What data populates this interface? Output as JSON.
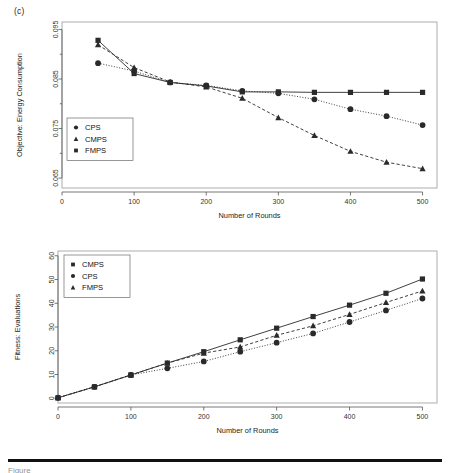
{
  "figure": {
    "panel_label": "(c)",
    "caption_fragment": "Figure"
  },
  "chart_data": [
    {
      "type": "line",
      "id": "objective-energy-consumption",
      "title": "",
      "xlabel": "Number of Rounds",
      "ylabel": "Objective: Energy Consumption",
      "xlim": [
        0,
        520
      ],
      "ylim": [
        0.063,
        0.0965
      ],
      "xticks": [
        0,
        100,
        200,
        300,
        400,
        500
      ],
      "yticks": [
        0.065,
        0.075,
        0.085,
        0.095
      ],
      "ytick_labels": [
        "0.065",
        "0.075",
        "0.085",
        "0.095"
      ],
      "xtick_labels": [
        "0",
        "100",
        "200",
        "300",
        "400",
        "500"
      ],
      "minor_ticks": true,
      "grid": false,
      "legend_position": "left-middle",
      "x": [
        50,
        100,
        150,
        200,
        250,
        300,
        350,
        400,
        450,
        500
      ],
      "series": [
        {
          "name": "CPS",
          "marker": "circle",
          "line_style": "dotted",
          "values": [
            0.0882,
            0.0866,
            0.0843,
            0.0837,
            0.0826,
            0.0821,
            0.0809,
            0.0789,
            0.0775,
            0.0757
          ]
        },
        {
          "name": "CMPS",
          "marker": "triangle",
          "line_style": "dashed",
          "values": [
            0.0919,
            0.0873,
            0.0844,
            0.0834,
            0.0811,
            0.0772,
            0.0736,
            0.0704,
            0.0682,
            0.0669
          ]
        },
        {
          "name": "FMPS",
          "marker": "square",
          "line_style": "solid",
          "values": [
            0.0928,
            0.0861,
            0.0843,
            0.0836,
            0.0824,
            0.0824,
            0.0823,
            0.0823,
            0.0823,
            0.0823
          ]
        }
      ],
      "legend": [
        "CPS",
        "CMPS",
        "FMPS"
      ]
    },
    {
      "type": "line",
      "id": "fitness-evaluations",
      "title": "",
      "xlabel": "Number of Rounds",
      "ylabel": "Fitness: Evaluations",
      "xlim": [
        0,
        520
      ],
      "ylim": [
        -2,
        62
      ],
      "xticks": [
        0,
        100,
        200,
        300,
        400,
        500
      ],
      "yticks": [
        0,
        10,
        20,
        30,
        40,
        50,
        60
      ],
      "ytick_labels": [
        "0",
        "10",
        "20",
        "30",
        "40",
        "50",
        "60"
      ],
      "xtick_labels": [
        "0",
        "100",
        "200",
        "300",
        "400",
        "500"
      ],
      "minor_ticks": false,
      "grid": false,
      "legend_position": "top-left",
      "x": [
        0,
        50,
        100,
        150,
        200,
        250,
        300,
        350,
        400,
        450,
        500
      ],
      "series": [
        {
          "name": "CMPS",
          "marker": "square",
          "line_style": "solid",
          "values": [
            0.2,
            4.8,
            9.8,
            14.8,
            19.6,
            24.6,
            29.5,
            34.4,
            39.2,
            44.2,
            50.2
          ]
        },
        {
          "name": "CPS",
          "marker": "circle",
          "line_style": "dotted",
          "values": [
            0.2,
            4.8,
            9.8,
            12.6,
            15.5,
            19.6,
            23.4,
            27.3,
            32.1,
            37.0,
            42.0
          ]
        },
        {
          "name": "FMPS",
          "marker": "triangle",
          "line_style": "dashed",
          "values": [
            0.2,
            4.8,
            9.8,
            14.8,
            19.0,
            21.6,
            26.5,
            30.5,
            35.3,
            40.3,
            45.2
          ]
        }
      ],
      "legend": [
        "CMPS",
        "CPS",
        "FMPS"
      ]
    }
  ]
}
